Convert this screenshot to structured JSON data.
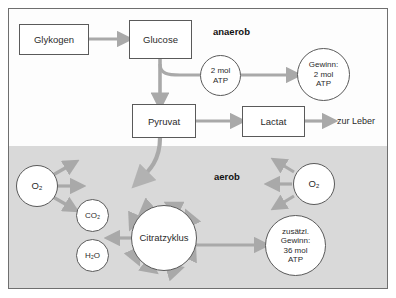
{
  "diagram": {
    "colors": {
      "arrow": "#a9a9a9",
      "frame_border": "#6f6f6f",
      "node_border": "#5a5a5a",
      "aerob_band": "#d9d9d9",
      "anaerob_band": "#fdfdfd",
      "text": "#2b2b2b"
    },
    "phases": [
      {
        "name": "anaerob-label",
        "label": "anaerob"
      },
      {
        "name": "aerob-label",
        "label": "aerob"
      }
    ],
    "boxes": [
      {
        "name": "glykogen",
        "label": "Glykogen"
      },
      {
        "name": "glucose",
        "label": "Glucose"
      },
      {
        "name": "pyruvat",
        "label": "Pyruvat"
      },
      {
        "name": "lactat",
        "label": "Lactat"
      }
    ],
    "circles": [
      {
        "name": "atp-2mol",
        "lines": [
          "2 mol",
          "ATP"
        ]
      },
      {
        "name": "gewinn-2mol-atp",
        "lines": [
          "Gewinn:",
          "2 mol",
          "ATP"
        ]
      },
      {
        "name": "oxygen-left",
        "lines": [
          "O₂"
        ]
      },
      {
        "name": "oxygen-right",
        "lines": [
          "O₂"
        ]
      },
      {
        "name": "carbon-dioxide",
        "lines": [
          "CO₂"
        ]
      },
      {
        "name": "water",
        "lines": [
          "H₂O"
        ]
      },
      {
        "name": "citratzyklus",
        "lines": [
          "Citratzyklus"
        ]
      },
      {
        "name": "zusaetzlicher-gewinn",
        "lines": [
          "zusätzl.",
          "Gewinn:",
          "36 mol",
          "ATP"
        ]
      }
    ],
    "labels": [
      {
        "name": "zur-leber",
        "label": "zur Leber"
      }
    ],
    "o2_left_text": "O₂",
    "o2_right_text": "O₂",
    "co2_text": "CO₂",
    "h2o_text": "H₂O",
    "citrat_text": "Citratzyklus",
    "zur_leber_text": "zur Leber",
    "anaerob_text": "anaerob",
    "aerob_text": "aerob",
    "glykogen_text": "Glykogen",
    "glucose_text": "Glucose",
    "pyruvat_text": "Pyruvat",
    "lactat_text": "Lactat",
    "atp2_l1": "2 mol",
    "atp2_l2": "ATP",
    "gewinn_l1": "Gewinn:",
    "gewinn_l2": "2 mol",
    "gewinn_l3": "ATP",
    "zus_l1": "zusätzl.",
    "zus_l2": "Gewinn:",
    "zus_l3": "36 mol",
    "zus_l4": "ATP"
  }
}
